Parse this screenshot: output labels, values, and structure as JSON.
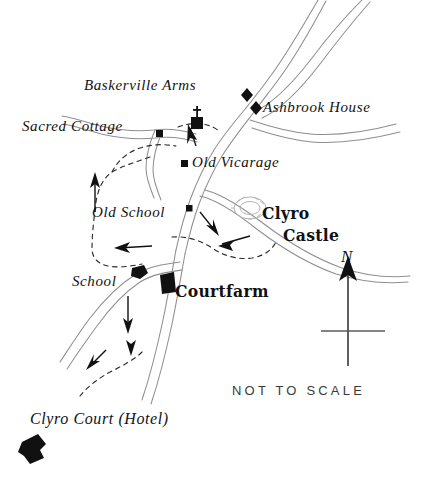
{
  "map": {
    "title": "Clyro sketch map",
    "scale_note": "NOT TO SCALE",
    "north_label": "N",
    "ink_color": "#111111",
    "road_color": "#8a8a8a",
    "paper_color": "#ffffff",
    "labels": [
      {
        "id": "baskerville-arms",
        "text": "Baskerville Arms",
        "style": "italic",
        "x": 84,
        "y": 78
      },
      {
        "id": "ashbrook-house",
        "text": "Ashbrook House",
        "style": "italic",
        "x": 263,
        "y": 100
      },
      {
        "id": "sacred-cottage",
        "text": "Sacred Cottage",
        "style": "italic",
        "x": 22,
        "y": 119
      },
      {
        "id": "old-vicarage",
        "text": "Old Vicarage",
        "style": "italic",
        "x": 192,
        "y": 155
      },
      {
        "id": "old-school",
        "text": "Old School",
        "style": "italic",
        "x": 92,
        "y": 205
      },
      {
        "id": "clyro-castle-1",
        "text": "Clyro",
        "style": "gothic",
        "x": 262,
        "y": 205
      },
      {
        "id": "clyro-castle-2",
        "text": "Castle",
        "style": "gothic",
        "x": 283,
        "y": 227
      },
      {
        "id": "school",
        "text": "School",
        "style": "italic",
        "x": 72,
        "y": 274
      },
      {
        "id": "courtfarm",
        "text": "Courtfarm",
        "style": "gothic",
        "x": 175,
        "y": 283
      },
      {
        "id": "clyro-court-hotel",
        "text": "Clyro Court (Hotel)",
        "style": "italic",
        "x": 30,
        "y": 411
      },
      {
        "id": "not-to-scale",
        "text": "NOT TO SCALE",
        "style": "scale",
        "x": 232,
        "y": 384
      }
    ],
    "markers": [
      {
        "id": "baskerville-arms-marker",
        "shape": "diamond",
        "x": 247,
        "y": 95,
        "size": 7
      },
      {
        "id": "ashbrook-house-marker",
        "shape": "diamond",
        "x": 256,
        "y": 108,
        "size": 7
      },
      {
        "id": "sacred-cottage-marker",
        "shape": "square",
        "x": 159,
        "y": 133,
        "size": 6
      },
      {
        "id": "church-marker",
        "shape": "church",
        "x": 197,
        "y": 122,
        "size": 9
      },
      {
        "id": "old-vicarage-marker",
        "shape": "square",
        "x": 184,
        "y": 163,
        "size": 6
      },
      {
        "id": "old-school-marker",
        "shape": "square",
        "x": 189,
        "y": 208,
        "size": 6
      },
      {
        "id": "school-marker",
        "shape": "blob",
        "x": 138,
        "y": 272,
        "size": 9
      },
      {
        "id": "courtfarm-marker",
        "shape": "block",
        "x": 166,
        "y": 283,
        "size": 9
      },
      {
        "id": "clyro-court-marker",
        "shape": "estate",
        "x": 33,
        "y": 447,
        "size": 13
      },
      {
        "id": "castle-mound-marker",
        "shape": "mound",
        "x": 248,
        "y": 208,
        "size": 18
      }
    ],
    "annotations": {
      "direction_arrows": 6,
      "footpaths_dashed": 3,
      "roads": 7
    }
  }
}
